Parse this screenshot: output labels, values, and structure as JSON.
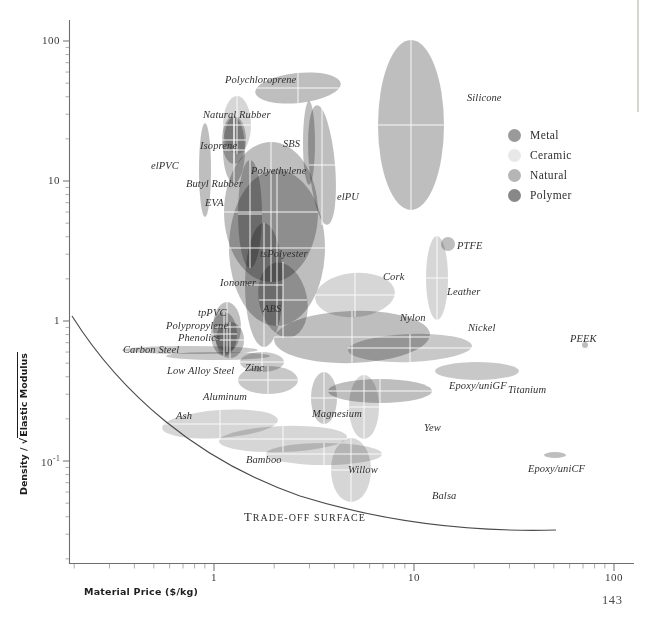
{
  "page_number": "143",
  "axes": {
    "x": {
      "label": "Material Price ($/kg)",
      "ticks": [
        "1",
        "10",
        "100"
      ],
      "range_decades": [
        0.28,
        110
      ]
    },
    "y": {
      "label_prefix": "Density / ",
      "label_radicand": "Elastic Modulus",
      "ticks": [
        "100",
        "10",
        "1",
        "10"
      ],
      "tick_exponent": "-1"
    }
  },
  "legend": {
    "items": [
      {
        "label": "Metal",
        "color": "#9a9a9a"
      },
      {
        "label": "Ceramic",
        "color": "#e8e8e8"
      },
      {
        "label": "Natural",
        "color": "#b5b5b5"
      },
      {
        "label": "Polymer",
        "color": "#888888"
      }
    ]
  },
  "annotations": {
    "tradeoff_caption_first": "T",
    "tradeoff_caption_rest": "RADE-OFF SURFACE"
  },
  "chart_data": {
    "type": "scatter",
    "title": "",
    "xlabel": "Material Price ($/kg)",
    "ylabel": "Density / sqrt(Elastic Modulus)",
    "xscale": "log",
    "yscale": "log",
    "xlim": [
      0.28,
      110
    ],
    "ylim": [
      0.028,
      130
    ],
    "grid": false,
    "legend_position": "upper-right",
    "note": "Ashby material selection bubble chart; each material is an ellipse (property range) colored by family.",
    "families": {
      "metal": "#9a9a9a",
      "ceramic": "#e8e8e8",
      "natural": "#b5b5b5",
      "polymer": "#888888"
    },
    "points": [
      {
        "label": "Polychloroprene",
        "family": "polymer",
        "x": 2.6,
        "y": 33,
        "cx": 298,
        "cy": 88,
        "rx": 43,
        "ry": 15,
        "rot": -6,
        "lx": 225,
        "ly": 75
      },
      {
        "label": "Natural Rubber",
        "family": "natural",
        "x": 1.55,
        "y": 24,
        "cx": 237,
        "cy": 125,
        "rx": 14,
        "ry": 29,
        "rot": 0,
        "lx": 203,
        "ly": 110
      },
      {
        "label": "Isoprene",
        "family": "polymer",
        "x": 1.5,
        "y": 19,
        "cx": 234,
        "cy": 140,
        "rx": 12,
        "ry": 24,
        "rot": 0,
        "lx": 200,
        "ly": 141
      },
      {
        "label": "elPVC",
        "family": "polymer",
        "x": 0.95,
        "y": 12.5,
        "cx": 205,
        "cy": 170,
        "rx": 6,
        "ry": 47,
        "rot": 0,
        "lx": 151,
        "ly": 161
      },
      {
        "label": "Butyl Rubber",
        "family": "polymer",
        "x": 1.5,
        "y": 10,
        "cx": 234,
        "cy": 150,
        "rx": 11,
        "ry": 33,
        "rot": 0,
        "lx": 186,
        "ly": 179
      },
      {
        "label": "SBS",
        "family": "polymer",
        "x": 3.0,
        "y": 18,
        "cx": 309,
        "cy": 143,
        "rx": 6,
        "ry": 42,
        "rot": 0,
        "lx": 283,
        "ly": 139
      },
      {
        "label": "Polyethylene",
        "family": "polymer",
        "x": 1.9,
        "y": 9.5,
        "cx": 271,
        "cy": 212,
        "rx": 47,
        "ry": 70,
        "rot": 0,
        "lx": 251,
        "ly": 166
      },
      {
        "label": "EVA",
        "family": "polymer",
        "x": 1.7,
        "y": 6.5,
        "cx": 250,
        "cy": 214,
        "rx": 12,
        "ry": 54,
        "rot": 0,
        "lx": 205,
        "ly": 198
      },
      {
        "label": "elPU",
        "family": "polymer",
        "x": 3.3,
        "y": 9.0,
        "cx": 322,
        "cy": 165,
        "rx": 13,
        "ry": 60,
        "rot": -5,
        "lx": 337,
        "ly": 192
      },
      {
        "label": "Silicone",
        "family": "polymer",
        "x": 9.0,
        "y": 25,
        "cx": 411,
        "cy": 125,
        "rx": 33,
        "ry": 85,
        "rot": 0,
        "lx": 467,
        "ly": 93
      },
      {
        "label": "tsPolyester",
        "family": "polymer",
        "x": 2.0,
        "y": 2.6,
        "cx": 277,
        "cy": 248,
        "rx": 48,
        "ry": 78,
        "rot": 0,
        "lx": 260,
        "ly": 249
      },
      {
        "label": "Ionomer",
        "family": "polymer",
        "x": 1.85,
        "y": 1.8,
        "cx": 264,
        "cy": 285,
        "rx": 19,
        "ry": 62,
        "rot": 0,
        "lx": 220,
        "ly": 278
      },
      {
        "label": "ABS",
        "family": "polymer",
        "x": 2.2,
        "y": 1.3,
        "cx": 283,
        "cy": 300,
        "rx": 24,
        "ry": 38,
        "rot": -12,
        "lx": 263,
        "ly": 304
      },
      {
        "label": "tpPVC",
        "family": "polymer",
        "x": 1.25,
        "y": 1.05,
        "cx": 227,
        "cy": 327,
        "rx": 14,
        "ry": 25,
        "rot": 0,
        "lx": 198,
        "ly": 308
      },
      {
        "label": "Polypropylene",
        "family": "polymer",
        "x": 1.2,
        "y": 0.95,
        "cx": 224,
        "cy": 334,
        "rx": 13,
        "ry": 22,
        "rot": 0,
        "lx": 166,
        "ly": 321
      },
      {
        "label": "Phenolics",
        "family": "polymer",
        "x": 1.3,
        "y": 0.85,
        "cx": 230,
        "cy": 340,
        "rx": 14,
        "ry": 18,
        "rot": 0,
        "lx": 178,
        "ly": 333
      },
      {
        "label": "Carbon Steel",
        "family": "metal",
        "x": 0.75,
        "y": 0.72,
        "cx": 190,
        "cy": 350,
        "rx": 68,
        "ry": 4,
        "rot": 0,
        "lx": 123,
        "ly": 345
      },
      {
        "label": "Low Alloy Steel",
        "family": "metal",
        "x": 1.1,
        "y": 0.68,
        "cx": 218,
        "cy": 356,
        "rx": 52,
        "ry": 4,
        "rot": 0,
        "lx": 167,
        "ly": 366
      },
      {
        "label": "Zinc",
        "family": "metal",
        "x": 1.8,
        "y": 0.62,
        "cx": 262,
        "cy": 362,
        "rx": 22,
        "ry": 10,
        "rot": 0,
        "lx": 245,
        "ly": 363
      },
      {
        "label": "Aluminum",
        "family": "metal",
        "x": 1.9,
        "y": 0.5,
        "cx": 268,
        "cy": 380,
        "rx": 30,
        "ry": 14,
        "rot": 0,
        "lx": 203,
        "ly": 392
      },
      {
        "label": "Magnesium",
        "family": "metal",
        "x": 3.3,
        "y": 0.42,
        "cx": 324,
        "cy": 398,
        "rx": 13,
        "ry": 26,
        "rot": 0,
        "lx": 312,
        "ly": 409
      },
      {
        "label": "Ash",
        "family": "natural",
        "x": 1.1,
        "y": 0.26,
        "cx": 220,
        "cy": 424,
        "rx": 58,
        "ry": 14,
        "rot": -4,
        "lx": 176,
        "ly": 411
      },
      {
        "label": "Bamboo",
        "family": "natural",
        "x": 2.1,
        "y": 0.18,
        "cx": 283,
        "cy": 439,
        "rx": 64,
        "ry": 13,
        "rot": -2,
        "lx": 246,
        "ly": 455
      },
      {
        "label": "Willow",
        "family": "natural",
        "x": 3.3,
        "y": 0.13,
        "cx": 324,
        "cy": 454,
        "rx": 58,
        "ry": 11,
        "rot": 0,
        "lx": 348,
        "ly": 465
      },
      {
        "label": "Balsa",
        "family": "natural",
        "x": 4.3,
        "y": 0.095,
        "cx": 351,
        "cy": 470,
        "rx": 20,
        "ry": 32,
        "rot": 0,
        "lx": 432,
        "ly": 491
      },
      {
        "label": "Yew",
        "family": "natural",
        "x": 5.2,
        "y": 0.22,
        "cx": 364,
        "cy": 407,
        "rx": 15,
        "ry": 32,
        "rot": 0,
        "lx": 424,
        "ly": 423
      },
      {
        "label": "Cork",
        "family": "natural",
        "x": 6.0,
        "y": 1.4,
        "cx": 355,
        "cy": 295,
        "rx": 40,
        "ry": 22,
        "rot": -5,
        "lx": 383,
        "ly": 272
      },
      {
        "label": "Leather",
        "family": "natural",
        "x": 8.5,
        "y": 1.6,
        "cx": 437,
        "cy": 278,
        "rx": 11,
        "ry": 42,
        "rot": 0,
        "lx": 447,
        "ly": 287
      },
      {
        "label": "PTFE",
        "family": "polymer",
        "x": 13.0,
        "y": 2.9,
        "cx": 448,
        "cy": 244,
        "rx": 7,
        "ry": 7,
        "rot": 0,
        "lx": 457,
        "ly": 241
      },
      {
        "label": "Nylon",
        "family": "polymer",
        "x": 4.2,
        "y": 0.92,
        "cx": 352,
        "cy": 337,
        "rx": 78,
        "ry": 26,
        "rot": -2,
        "lx": 400,
        "ly": 313
      },
      {
        "label": "Nickel",
        "family": "metal",
        "x": 13.0,
        "y": 0.75,
        "cx": 410,
        "cy": 348,
        "rx": 62,
        "ry": 14,
        "rot": -2,
        "lx": 468,
        "ly": 323
      },
      {
        "label": "Titanium",
        "family": "metal",
        "x": 22.0,
        "y": 0.55,
        "cx": 477,
        "cy": 371,
        "rx": 42,
        "ry": 9,
        "rot": 0,
        "lx": 508,
        "ly": 385
      },
      {
        "label": "Epoxy/uniGF",
        "family": "polymer",
        "x": 7.5,
        "y": 0.4,
        "cx": 380,
        "cy": 391,
        "rx": 52,
        "ry": 12,
        "rot": 0,
        "lx": 449,
        "ly": 381
      },
      {
        "label": "PEEK",
        "family": "polymer",
        "x": 62.0,
        "y": 0.72,
        "cx": 585,
        "cy": 345,
        "rx": 3,
        "ry": 3,
        "rot": 0,
        "lx": 570,
        "ly": 334
      },
      {
        "label": "Epoxy/uniCF",
        "family": "polymer",
        "x": 48.0,
        "y": 0.115,
        "cx": 555,
        "cy": 455,
        "rx": 11,
        "ry": 3,
        "rot": 0,
        "lx": 528,
        "ly": 464
      }
    ],
    "tradeoff_surface": {
      "label": "TRADE-OFF SURFACE",
      "path": "M 72,316 C 120,392 196,460 300,496 C 390,524 480,532 556,530"
    }
  }
}
